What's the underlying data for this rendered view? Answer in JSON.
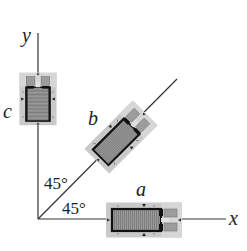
{
  "diagram": {
    "type": "strain-gauge-rosette",
    "axes": {
      "x_label": "x",
      "y_label": "y"
    },
    "gauges": [
      {
        "id": "a",
        "label": "a",
        "orientation_deg": 0
      },
      {
        "id": "b",
        "label": "b",
        "orientation_deg": 45
      },
      {
        "id": "c",
        "label": "c",
        "orientation_deg": 90
      }
    ],
    "angles": [
      {
        "label": "45°",
        "between": "b and y"
      },
      {
        "label": "45°",
        "between": "x and b"
      }
    ],
    "colors": {
      "line": "#333333",
      "gauge_backing": "#c8c8c8",
      "gauge_grid": "#8a8a8a",
      "gauge_frame": "#111111",
      "tab": "#a0a0a0"
    }
  }
}
